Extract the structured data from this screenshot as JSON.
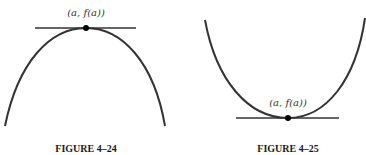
{
  "figures": [
    {
      "id": "fig-4-24",
      "caption": "FIGURE 4–24",
      "point_label": "(a, f(a))",
      "curve": "concave down (local maximum)",
      "tangent": "horizontal"
    },
    {
      "id": "fig-4-25",
      "caption": "FIGURE 4–25",
      "point_label": "(a, f(a))",
      "curve": "concave up (local minimum)",
      "tangent": "horizontal"
    }
  ],
  "colors": {
    "curve": "#333333",
    "point": "#000000",
    "text": "#1a1a1a"
  }
}
